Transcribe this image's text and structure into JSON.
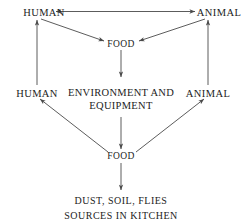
{
  "diagram": {
    "background_color": "#ffffff",
    "line_color": "#4a4a4a",
    "text_color": "#1c1c1c",
    "nodes": {
      "human_top": "HUMAN",
      "animal_top": "ANIMAL",
      "food_top": "FOOD",
      "human_mid": "HUMAN",
      "animal_mid": "ANIMAL",
      "environment": {
        "line1": "ENVIRONMENT  AND",
        "line2": "EQUIPMENT"
      },
      "food_bottom": "FOOD",
      "sources": {
        "line1": "DUST, SOIL, FLIES",
        "line2": "SOURCES IN KITCHEN"
      }
    },
    "edges": [
      {
        "id": "human-top-to-animal-top",
        "from": "human_top",
        "to": "animal_top",
        "style": "double-headed-horizontal"
      },
      {
        "id": "human-top-to-food-top",
        "from": "human_top",
        "to": "food_top",
        "style": "diagonal-arrow"
      },
      {
        "id": "animal-top-to-food-top",
        "from": "animal_top",
        "to": "food_top",
        "style": "diagonal-arrow"
      },
      {
        "id": "human-mid-to-human-top",
        "from": "human_mid",
        "to": "human_top",
        "style": "vertical-arrow-up"
      },
      {
        "id": "animal-mid-to-animal-top",
        "from": "animal_mid",
        "to": "animal_top",
        "style": "vertical-arrow-up"
      },
      {
        "id": "food-top-to-environment",
        "from": "food_top",
        "to": "environment",
        "style": "vertical-arrow-down"
      },
      {
        "id": "environment-to-food-bottom",
        "from": "environment",
        "to": "food_bottom",
        "style": "vertical-arrow-down"
      },
      {
        "id": "food-bottom-to-human-mid",
        "from": "food_bottom",
        "to": "human_mid",
        "style": "diagonal-arrow"
      },
      {
        "id": "food-bottom-to-animal-mid",
        "from": "food_bottom",
        "to": "animal_mid",
        "style": "diagonal-arrow"
      },
      {
        "id": "sources-to-food-bottom",
        "from": "sources",
        "to": "food_bottom",
        "style": "vertical-arrow-up"
      }
    ]
  }
}
